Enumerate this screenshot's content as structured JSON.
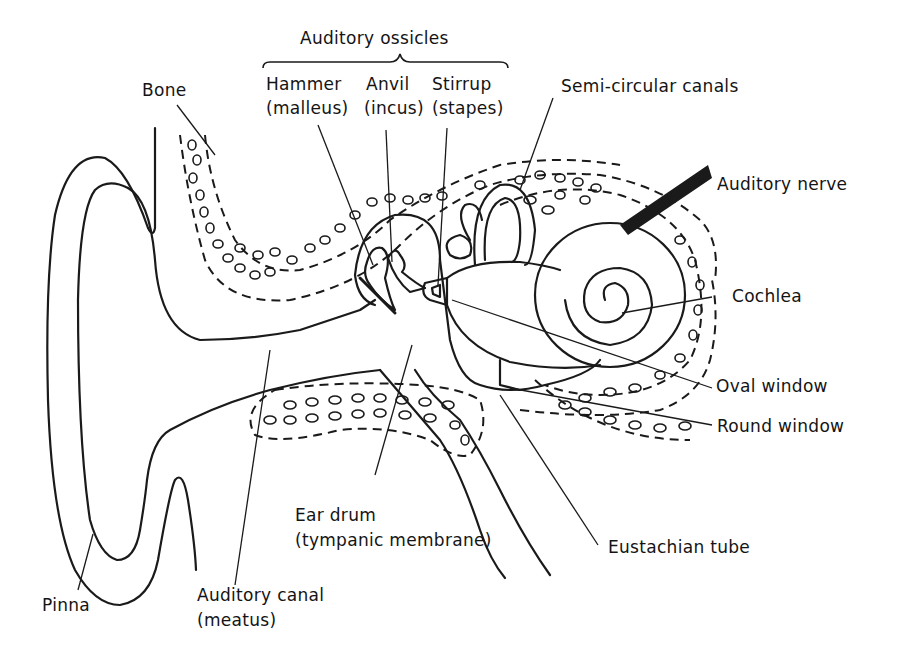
{
  "diagram": {
    "colors": {
      "ink": "#1a1a1a",
      "background": "#ffffff"
    },
    "labels": {
      "ossicles_group": "Auditory ossicles",
      "hammer": "Hammer",
      "hammer_latin": "(malleus)",
      "anvil": "Anvil",
      "anvil_latin": "(incus)",
      "stirrup": "Stirrup",
      "stirrup_latin": "(stapes)",
      "semicircular": "Semi-circular canals",
      "bone": "Bone",
      "auditory_nerve": "Auditory nerve",
      "cochlea": "Cochlea",
      "oval_window": "Oval window",
      "round_window": "Round window",
      "ear_drum": "Ear drum",
      "ear_drum_alt": "(tympanic membrane)",
      "eustachian": "Eustachian tube",
      "pinna": "Pinna",
      "canal": "Auditory canal",
      "canal_alt": "(meatus)"
    }
  }
}
